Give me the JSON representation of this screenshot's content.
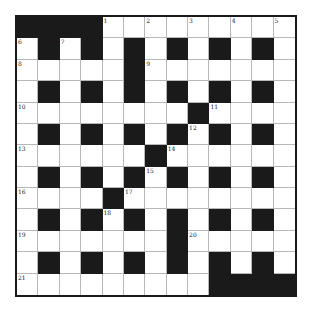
{
  "puzzle": {
    "type": "crossword",
    "rows": 13,
    "cols": 13,
    "colors": {
      "block": "#1a1a1a",
      "cell": "#ffffff",
      "gridline": "#b8b8b8",
      "frame": "#1a1a1a"
    },
    "grid": [
      "####.........",
      ".#.#.#.#.#.#.",
      ".....#.......",
      ".#.#.#.#.#.#.",
      "........#....",
      ".#.#.#.#.#.#.",
      "......#......",
      ".#.#.#.#.#.#.",
      "....#........",
      ".#.#.#.#.#.#.",
      ".......#.....",
      ".#.#.#.#.#.#.",
      ".........####"
    ],
    "numbers": [
      {
        "num": "1",
        "row": 0,
        "col": 4
      },
      {
        "num": "2",
        "row": 0,
        "col": 6
      },
      {
        "num": "3",
        "row": 0,
        "col": 8
      },
      {
        "num": "4",
        "row": 0,
        "col": 10
      },
      {
        "num": "5",
        "row": 0,
        "col": 12
      },
      {
        "num": "6",
        "row": 1,
        "col": 0
      },
      {
        "num": "7",
        "row": 1,
        "col": 2
      },
      {
        "num": "8",
        "row": 2,
        "col": 0
      },
      {
        "num": "9",
        "row": 2,
        "col": 6
      },
      {
        "num": "10",
        "row": 4,
        "col": 0
      },
      {
        "num": "11",
        "row": 4,
        "col": 9
      },
      {
        "num": "12",
        "row": 5,
        "col": 8
      },
      {
        "num": "13",
        "row": 6,
        "col": 0
      },
      {
        "num": "14",
        "row": 6,
        "col": 7
      },
      {
        "num": "15",
        "row": 7,
        "col": 6
      },
      {
        "num": "16",
        "row": 8,
        "col": 0
      },
      {
        "num": "17",
        "row": 8,
        "col": 5
      },
      {
        "num": "18",
        "row": 9,
        "col": 4
      },
      {
        "num": "19",
        "row": 10,
        "col": 0
      },
      {
        "num": "20",
        "row": 10,
        "col": 8
      },
      {
        "num": "21",
        "row": 12,
        "col": 0
      }
    ]
  }
}
